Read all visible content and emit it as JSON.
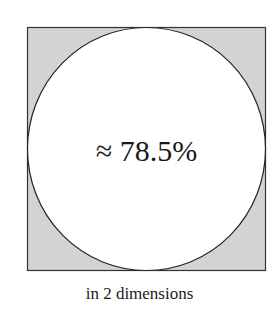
{
  "figure": {
    "label": "≈ 78.5%",
    "caption": "in 2 dimensions",
    "square": {
      "x": 27,
      "y": 27,
      "width": 239,
      "height": 244
    },
    "circle": {
      "cx": 146.5,
      "cy": 149,
      "rx": 119.5,
      "ry": 122
    },
    "colors": {
      "square_fill": "#d3d3d3",
      "circle_fill": "#ffffff",
      "stroke": "#333333",
      "text": "#1a1a1a"
    }
  }
}
